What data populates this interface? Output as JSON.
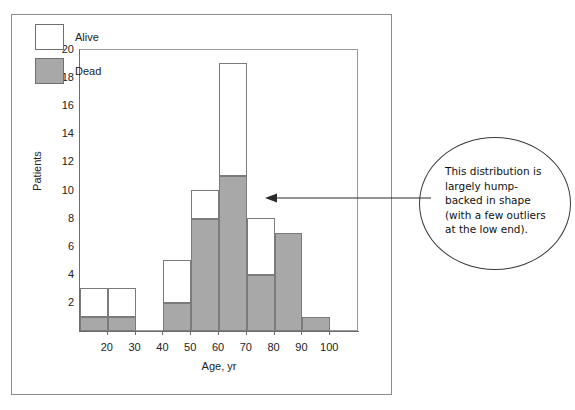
{
  "figure": {
    "annotation": {
      "text": "This distribution is largely hump-backed in shape (with a few outliers at the low end).",
      "arrow": "left-pointing-arrow"
    }
  },
  "chart_data": {
    "type": "bar",
    "subtype": "stacked-histogram",
    "title": "",
    "xlabel": "Age, yr",
    "ylabel": "Patients",
    "xlim": [
      10,
      110
    ],
    "ylim": [
      0,
      20
    ],
    "grid": false,
    "legend_position": "top-left",
    "bin_width": 10,
    "bin_starts": [
      10,
      20,
      30,
      40,
      50,
      60,
      70,
      80,
      90
    ],
    "bin_labels": [
      "10-20",
      "20-30",
      "30-40",
      "40-50",
      "50-60",
      "60-70",
      "70-80",
      "80-90",
      "90-100"
    ],
    "x_ticks": [
      20,
      30,
      40,
      50,
      60,
      70,
      80,
      90,
      100
    ],
    "y_ticks": [
      2,
      4,
      6,
      8,
      10,
      12,
      14,
      16,
      18,
      20
    ],
    "series": [
      {
        "name": "Dead",
        "color": "#a8a8a8",
        "values": [
          1,
          1,
          0,
          2,
          8,
          11,
          4,
          7,
          1
        ]
      },
      {
        "name": "Alive",
        "color": "#ffffff",
        "values": [
          2,
          2,
          0,
          3,
          2,
          8,
          4,
          0,
          0
        ]
      }
    ],
    "totals": [
      3,
      3,
      0,
      5,
      10,
      19,
      8,
      7,
      1
    ]
  }
}
